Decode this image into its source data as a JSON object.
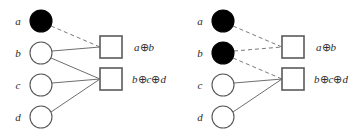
{
  "diagram": {
    "type": "tanner-graph-bipartite",
    "panels": [
      {
        "id": "left",
        "name": "panel-left",
        "origin_x": 0,
        "variable_nodes": [
          {
            "label": "a",
            "filled": true,
            "cx": 41,
            "cy": 21,
            "r": 11,
            "label_x": 18,
            "label_y": 25
          },
          {
            "label": "b",
            "filled": false,
            "cx": 41,
            "cy": 53,
            "r": 11,
            "label_x": 18,
            "label_y": 57
          },
          {
            "label": "c",
            "filled": false,
            "cx": 41,
            "cy": 85,
            "r": 11,
            "label_x": 18,
            "label_y": 89
          },
          {
            "label": "d",
            "filled": false,
            "cx": 41,
            "cy": 117,
            "r": 11,
            "label_x": 18,
            "label_y": 121
          }
        ],
        "check_nodes": [
          {
            "id": "c1",
            "x": 100,
            "y": 36,
            "size": 22,
            "label_parts": [
              {
                "t": "a",
                "k": "v"
              },
              {
                "t": "⊕",
                "k": "op"
              },
              {
                "t": "b",
                "k": "v"
              }
            ],
            "label_x": 134,
            "label_y": 51
          },
          {
            "id": "c2",
            "x": 100,
            "y": 68,
            "size": 22,
            "label_parts": [
              {
                "t": "b",
                "k": "v"
              },
              {
                "t": "⊕",
                "k": "op"
              },
              {
                "t": "c",
                "k": "v"
              },
              {
                "t": "⊕",
                "k": "op"
              },
              {
                "t": "d",
                "k": "v"
              }
            ],
            "label_x": 132,
            "label_y": 83
          }
        ],
        "edges": [
          {
            "from": "a",
            "to": "c1",
            "style": "dashed",
            "x1": 51,
            "y1": 26,
            "x2": 100,
            "y2": 47
          },
          {
            "from": "b",
            "to": "c1",
            "style": "solid",
            "x1": 52,
            "y1": 51,
            "x2": 100,
            "y2": 47
          },
          {
            "from": "b",
            "to": "c2",
            "style": "solid",
            "x1": 51,
            "y1": 58,
            "x2": 100,
            "y2": 79
          },
          {
            "from": "c",
            "to": "c2",
            "style": "solid",
            "x1": 52,
            "y1": 83,
            "x2": 100,
            "y2": 79
          },
          {
            "from": "d",
            "to": "c2",
            "style": "solid",
            "x1": 51,
            "y1": 112,
            "x2": 100,
            "y2": 79
          }
        ]
      },
      {
        "id": "right",
        "name": "panel-right",
        "origin_x": 182,
        "variable_nodes": [
          {
            "label": "a",
            "filled": true,
            "cx": 223,
            "cy": 21,
            "r": 11,
            "label_x": 200,
            "label_y": 25
          },
          {
            "label": "b",
            "filled": true,
            "cx": 223,
            "cy": 53,
            "r": 11,
            "label_x": 200,
            "label_y": 57
          },
          {
            "label": "c",
            "filled": false,
            "cx": 223,
            "cy": 85,
            "r": 11,
            "label_x": 200,
            "label_y": 89
          },
          {
            "label": "d",
            "filled": false,
            "cx": 223,
            "cy": 117,
            "r": 11,
            "label_x": 200,
            "label_y": 121
          }
        ],
        "check_nodes": [
          {
            "id": "c1",
            "x": 282,
            "y": 36,
            "size": 22,
            "label_parts": [
              {
                "t": "a",
                "k": "v"
              },
              {
                "t": "⊕",
                "k": "op"
              },
              {
                "t": "b",
                "k": "v"
              }
            ],
            "label_x": 316,
            "label_y": 51
          },
          {
            "id": "c2",
            "x": 282,
            "y": 68,
            "size": 22,
            "label_parts": [
              {
                "t": "b",
                "k": "v"
              },
              {
                "t": "⊕",
                "k": "op"
              },
              {
                "t": "c",
                "k": "v"
              },
              {
                "t": "⊕",
                "k": "op"
              },
              {
                "t": "d",
                "k": "v"
              }
            ],
            "label_x": 314,
            "label_y": 83
          }
        ],
        "edges": [
          {
            "from": "a",
            "to": "c1",
            "style": "dashed",
            "x1": 233,
            "y1": 26,
            "x2": 282,
            "y2": 47
          },
          {
            "from": "b",
            "to": "c1",
            "style": "dashed",
            "x1": 234,
            "y1": 51,
            "x2": 282,
            "y2": 47
          },
          {
            "from": "b",
            "to": "c2",
            "style": "dashed",
            "x1": 233,
            "y1": 58,
            "x2": 282,
            "y2": 79
          },
          {
            "from": "c",
            "to": "c2",
            "style": "solid",
            "x1": 234,
            "y1": 83,
            "x2": 282,
            "y2": 79
          },
          {
            "from": "d",
            "to": "c2",
            "style": "solid",
            "x1": 233,
            "y1": 112,
            "x2": 282,
            "y2": 79
          }
        ]
      }
    ],
    "colors": {
      "node_filled": "#000000",
      "node_stroke": "#555555",
      "edge_solid": "#6e6e6e",
      "edge_dashed": "#7a7a7a",
      "square_stroke": "#5a5a5a",
      "text": "#2b2b2b",
      "background": "#ffffff"
    },
    "stroke_widths": {
      "circle": 1.1,
      "square": 1.6,
      "edge": 1.0
    },
    "dash_pattern": "4 3"
  }
}
